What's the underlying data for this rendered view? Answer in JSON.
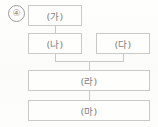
{
  "question": {
    "marker_label": "④"
  },
  "diagram": {
    "type": "flowchart",
    "orientation": "top-down",
    "nodes": [
      {
        "id": "ga",
        "label": "(가)",
        "row": 1,
        "span": "half-left"
      },
      {
        "id": "na",
        "label": "(나)",
        "row": 2,
        "span": "half-left"
      },
      {
        "id": "da",
        "label": "(다)",
        "row": 2,
        "span": "half-right"
      },
      {
        "id": "ra",
        "label": "(라)",
        "row": 3,
        "span": "full"
      },
      {
        "id": "ma",
        "label": "(마)",
        "row": 4,
        "span": "full"
      }
    ],
    "edges": [
      {
        "from": "ga",
        "to": "na",
        "style": "vertical-line"
      },
      {
        "from": "na",
        "to": "ra",
        "style": "merge-junction"
      },
      {
        "from": "da",
        "to": "ra",
        "style": "merge-junction"
      },
      {
        "from": "ra",
        "to": "ma",
        "style": "vertical-line"
      }
    ]
  },
  "colors": {
    "background": "#fdfdfb",
    "box_border": "#c9c9c6",
    "box_fill": "#fefefd",
    "text": "#7e7e7c",
    "marker_border": "#9b9b99",
    "marker_text": "#8d8d8b",
    "connector": "#c9c9c6"
  }
}
